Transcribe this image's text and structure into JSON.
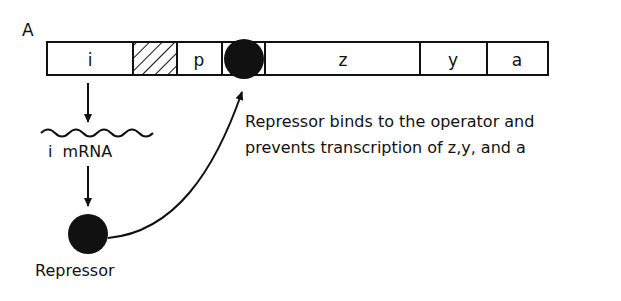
{
  "figure": {
    "panel_label": "A",
    "operon": {
      "segments": [
        {
          "id": "i",
          "label": "i",
          "pattern": "plain"
        },
        {
          "id": "promoter-i",
          "label": "",
          "pattern": "hatched"
        },
        {
          "id": "p",
          "label": "p",
          "pattern": "plain"
        },
        {
          "id": "o",
          "label": "",
          "pattern": "operator-bound"
        },
        {
          "id": "z",
          "label": "z",
          "pattern": "plain"
        },
        {
          "id": "y",
          "label": "y",
          "pattern": "plain"
        },
        {
          "id": "a",
          "label": "a",
          "pattern": "plain"
        }
      ]
    },
    "mrna_label": "i  mRNA",
    "repressor_label": "Repressor",
    "caption_line1": "Repressor binds to the operator and",
    "caption_line2": "prevents transcription of z,y, and a"
  }
}
